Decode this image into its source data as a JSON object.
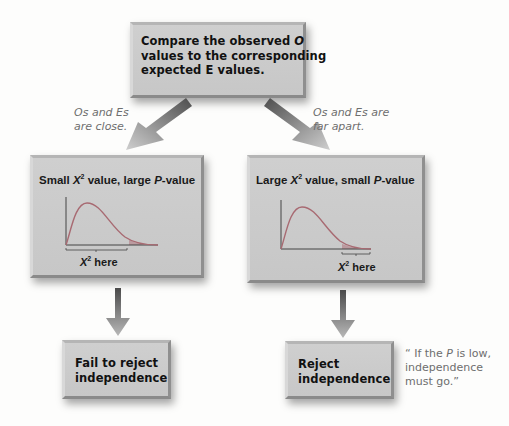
{
  "top_box": {
    "line1_prefix": "Compare the observed ",
    "line1_var": "O",
    "line2": "values to the corresponding",
    "line3": "expected E values."
  },
  "branches": {
    "left_note": {
      "line1": "Os and Es",
      "line2": "are close."
    },
    "right_note": {
      "line1": "Os and Es are",
      "line2": "far apart."
    }
  },
  "left_panel": {
    "title_prefix": "Small ",
    "title_var": "X",
    "title_sup": "2",
    "title_mid": " value, large ",
    "title_p": "P",
    "title_suffix": "-value",
    "xlabel_var": "X",
    "xlabel_sup": "2",
    "xlabel_text": " here"
  },
  "right_panel": {
    "title_prefix": "Large ",
    "title_var": "X",
    "title_sup": "2",
    "title_mid": " value, small ",
    "title_p": "P",
    "title_suffix": "-value",
    "xlabel_var": "X",
    "xlabel_sup": "2",
    "xlabel_text": " here"
  },
  "bottom_left": {
    "line1": "Fail to reject",
    "line2": "independence"
  },
  "bottom_right": {
    "line1": "Reject",
    "line2": "independence"
  },
  "quote": {
    "line1_prefix": "“ If the ",
    "line1_var": "P",
    "line1_suffix": " is low,",
    "line2": "independence",
    "line3": "must go.”"
  },
  "colors": {
    "box_fill": "#cbcbcb",
    "curve": "#a86a72",
    "tail_shade": "#b89096",
    "note_text": "#6e6e6e",
    "arrow_dark": "#5a5a5a",
    "arrow_light": "#c9c9c9"
  }
}
